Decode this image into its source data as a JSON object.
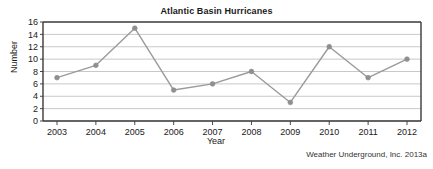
{
  "figure": {
    "source_note": "Weather Underground, Inc. 2013a"
  },
  "chart_data": {
    "type": "line",
    "title": "Atlantic Basin Hurricanes",
    "xlabel": "Year",
    "ylabel": "Number",
    "categories": [
      "2003",
      "2004",
      "2005",
      "2006",
      "2007",
      "2008",
      "2009",
      "2010",
      "2011",
      "2012"
    ],
    "values": [
      7,
      9,
      15,
      5,
      6,
      8,
      3,
      12,
      7,
      10
    ],
    "x": [
      2003,
      2004,
      2005,
      2006,
      2007,
      2008,
      2009,
      2010,
      2011,
      2012
    ],
    "ylim": [
      0,
      16
    ],
    "yticks": [
      0,
      2,
      4,
      6,
      8,
      10,
      12,
      14,
      16
    ],
    "ytick_labels": [
      "0",
      "2",
      "4",
      "6",
      "8",
      "10",
      "12",
      "14",
      "16"
    ],
    "xtick_labels": [
      "2003",
      "2004",
      "2005",
      "2006",
      "2007",
      "2008",
      "2009",
      "2010",
      "2011",
      "2012"
    ],
    "grid": "horizontal",
    "legend": "none",
    "series": [
      {
        "name": "Atlantic Basin Hurricanes",
        "values": [
          7,
          9,
          15,
          5,
          6,
          8,
          3,
          12,
          7,
          10
        ],
        "line_color": "#9a9a9a",
        "marker_color": "#8f8f8f",
        "marker": "circle"
      }
    ],
    "colors": {
      "line": "#9a9a9a",
      "marker": "#8f8f8f",
      "gridline": "#c8c8c8",
      "axis": "#4a4a4a",
      "text": "#1a1a1a",
      "background": "#ffffff"
    }
  }
}
